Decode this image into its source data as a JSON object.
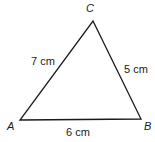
{
  "diagram": {
    "type": "triangle",
    "stroke_color": "#1a1a1a",
    "text_color": "#1a1a1a",
    "background": "#ffffff",
    "vertices": {
      "A": {
        "label": "A",
        "x": 20,
        "y": 120
      },
      "B": {
        "label": "B",
        "x": 141,
        "y": 119
      },
      "C": {
        "label": "C",
        "x": 93,
        "y": 21
      }
    },
    "sides": {
      "AC": {
        "label": "7 cm",
        "length": 7,
        "unit": "cm"
      },
      "CB": {
        "label": "5 cm",
        "length": 5,
        "unit": "cm"
      },
      "AB": {
        "label": "6 cm",
        "length": 6,
        "unit": "cm"
      }
    }
  }
}
